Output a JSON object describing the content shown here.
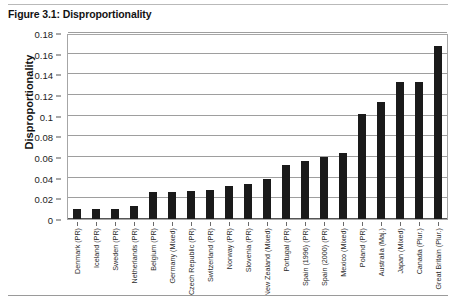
{
  "figure": {
    "title": "Figure 3.1: Disproportionality"
  },
  "chart_data": {
    "type": "bar",
    "title": "Figure 3.1: Disproportionality",
    "xlabel": "",
    "ylabel": "Disproportionality",
    "ylim": [
      0,
      0.18
    ],
    "yticks": [
      "0",
      "0.02",
      "0.04",
      "0.06",
      "0.08",
      "0.1",
      "0.12",
      "0.14",
      "0.16",
      "0.18"
    ],
    "ytick_values": [
      0,
      0.02,
      0.04,
      0.06,
      0.08,
      0.1,
      0.12,
      0.14,
      0.16,
      0.18
    ],
    "grid": true,
    "legend": "none",
    "bar_color": "#1a1a1a",
    "categories": [
      "Denmark (PR)",
      "Iceland (PR)",
      "Sweden (PR)",
      "Netherlands (PR)",
      "Belgium (PR)",
      "Germany (Mixed)",
      "Czech Republic (PR)",
      "Switzerland (PR)",
      "Norway (PR)",
      "Slovenia (PR)",
      "New Zealand (Mixed)",
      "Portugal (PR)",
      "Spain (1996) (PR)",
      "Spain (2000) (PR)",
      "Mexico (Mixed)",
      "Poland (PR)",
      "Australia (Maj.)",
      "Japan (Mixed)",
      "Canada (Plur.)",
      "Great Britain (Plur.)"
    ],
    "values": [
      0.01,
      0.01,
      0.01,
      0.013,
      0.026,
      0.026,
      0.027,
      0.028,
      0.032,
      0.034,
      0.039,
      0.052,
      0.056,
      0.06,
      0.064,
      0.102,
      0.113,
      0.133,
      0.133,
      0.167
    ]
  }
}
